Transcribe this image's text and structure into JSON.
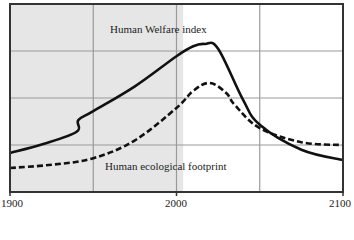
{
  "chart_data": {
    "type": "line",
    "title": "",
    "xlabel": "",
    "ylabel": "",
    "xlim": [
      1900,
      2100
    ],
    "ylim": [
      0,
      4
    ],
    "x_ticks": [
      "1900",
      "2000",
      "2100"
    ],
    "grid": true,
    "shaded_region": {
      "from": 1900,
      "to": 2004,
      "color": "#e6e6e6",
      "meaning": "historical period"
    },
    "series": [
      {
        "name": "Human Welfare index",
        "style": "solid",
        "color": "#111111",
        "x": [
          1900,
          1920,
          1940,
          1941,
          1950,
          1975,
          2000,
          2010,
          2017,
          2025,
          2040,
          2050,
          2075,
          2100
        ],
        "values": [
          0.83,
          1.02,
          1.28,
          1.53,
          1.72,
          2.25,
          2.89,
          3.1,
          3.15,
          3.05,
          1.96,
          1.43,
          0.9,
          0.68
        ]
      },
      {
        "name": "Human ecological footprint",
        "style": "dashed",
        "color": "#111111",
        "x": [
          1900,
          1925,
          1950,
          1975,
          2000,
          2010,
          2020,
          2030,
          2035,
          2050,
          2075,
          2100
        ],
        "values": [
          0.51,
          0.58,
          0.72,
          1.1,
          1.79,
          2.15,
          2.32,
          2.1,
          1.85,
          1.36,
          1.06,
          1.0
        ]
      }
    ],
    "annotations": [
      {
        "text": "Human Welfare index",
        "x": 1960,
        "y": 3.5
      },
      {
        "text": "Human ecological footprint",
        "x": 1955,
        "y": 0.4
      }
    ]
  },
  "labels": {
    "welfare": "Human Welfare index",
    "footprint": "Human ecological footprint",
    "tick_1900": "1900",
    "tick_2000": "2000",
    "tick_2100": "2100"
  }
}
